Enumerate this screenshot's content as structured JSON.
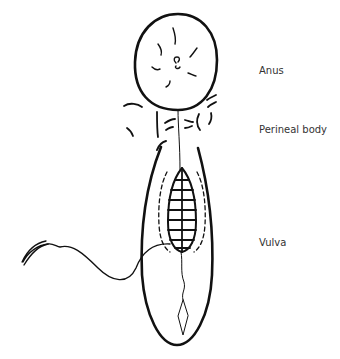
{
  "labels": {
    "anus": "Anus",
    "perineal_body": "Perineal body",
    "vulva": "Vulva"
  },
  "colors": {
    "ink": "#111111",
    "text": "#333333",
    "background": "#ffffff"
  }
}
